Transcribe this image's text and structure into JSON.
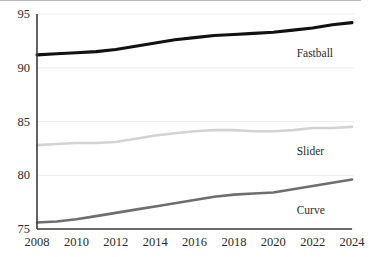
{
  "chart_data": {
    "type": "line",
    "title": "",
    "subtitle": "",
    "xlabel": "",
    "ylabel": "",
    "xlim": [
      2008,
      2024
    ],
    "ylim": [
      75,
      95
    ],
    "yticks": [
      75,
      80,
      85,
      90,
      95
    ],
    "xticks": [
      2008,
      2010,
      2012,
      2014,
      2016,
      2018,
      2020,
      2022,
      2024
    ],
    "grid": "horizontal",
    "legend_position": "inline-right-of-series",
    "x": [
      2008,
      2009,
      2010,
      2011,
      2012,
      2013,
      2014,
      2015,
      2016,
      2017,
      2018,
      2019,
      2020,
      2021,
      2022,
      2023,
      2024
    ],
    "series": [
      {
        "name": "Fastball",
        "color": "#111111",
        "label_value_x": 2022,
        "values": [
          91.2,
          91.3,
          91.4,
          91.5,
          91.7,
          92.0,
          92.3,
          92.6,
          92.8,
          93.0,
          93.1,
          93.2,
          93.3,
          93.5,
          93.7,
          94.0,
          94.2
        ]
      },
      {
        "name": "Slider",
        "color": "#d3d3d3",
        "label_value_x": 2022,
        "values": [
          82.8,
          82.9,
          83.0,
          83.0,
          83.1,
          83.4,
          83.7,
          83.9,
          84.1,
          84.2,
          84.2,
          84.1,
          84.1,
          84.2,
          84.4,
          84.4,
          84.5
        ]
      },
      {
        "name": "Curve",
        "color": "#6e6e6e",
        "label_value_x": 2022,
        "values": [
          75.6,
          75.7,
          75.9,
          76.2,
          76.5,
          76.8,
          77.1,
          77.4,
          77.7,
          78.0,
          78.2,
          78.3,
          78.4,
          78.7,
          79.0,
          79.3,
          79.6
        ]
      }
    ]
  },
  "axes": {
    "y_tick_labels": [
      "95",
      "90",
      "85",
      "80",
      "75"
    ],
    "x_tick_labels": [
      "2008",
      "2010",
      "2012",
      "2014",
      "2016",
      "2018",
      "2020",
      "2022",
      "2024"
    ]
  },
  "series_labels": [
    {
      "text": "Fastball",
      "series": "Fastball"
    },
    {
      "text": "Slider",
      "series": "Slider"
    },
    {
      "text": "Curve",
      "series": "Curve"
    }
  ],
  "colors": {
    "fastball": "#111111",
    "slider": "#d3d3d3",
    "curve": "#6e6e6e",
    "axis": "#3a3a3a",
    "grid": "#eeeeee",
    "text": "#2b2b2b",
    "background": "#ffffff"
  }
}
